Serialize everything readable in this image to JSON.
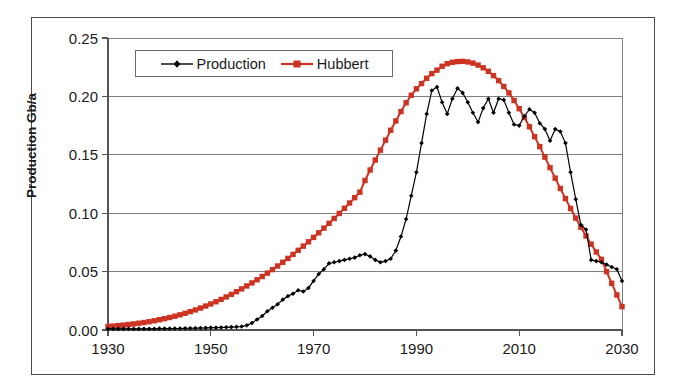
{
  "chart_data": {
    "type": "line",
    "title": "",
    "xlabel": "",
    "ylabel": "Production Gb/a",
    "xlim": [
      1930,
      2030
    ],
    "ylim": [
      0.0,
      0.25
    ],
    "grid": true,
    "legend_position": "top-left-inside",
    "x_ticks": [
      "1930",
      "1950",
      "1970",
      "1990",
      "2010",
      "2030"
    ],
    "x_tick_values": [
      1930,
      1950,
      1970,
      1990,
      2010,
      2030
    ],
    "y_ticks": [
      "0.00",
      "0.05",
      "0.10",
      "0.15",
      "0.20",
      "0.25"
    ],
    "y_tick_values": [
      0.0,
      0.05,
      0.1,
      0.15,
      0.2,
      0.25
    ],
    "x": [
      1930,
      1931,
      1932,
      1933,
      1934,
      1935,
      1936,
      1937,
      1938,
      1939,
      1940,
      1941,
      1942,
      1943,
      1944,
      1945,
      1946,
      1947,
      1948,
      1949,
      1950,
      1951,
      1952,
      1953,
      1954,
      1955,
      1956,
      1957,
      1958,
      1959,
      1960,
      1961,
      1962,
      1963,
      1964,
      1965,
      1966,
      1967,
      1968,
      1969,
      1970,
      1971,
      1972,
      1973,
      1974,
      1975,
      1976,
      1977,
      1978,
      1979,
      1980,
      1981,
      1982,
      1983,
      1984,
      1985,
      1986,
      1987,
      1988,
      1989,
      1990,
      1991,
      1992,
      1993,
      1994,
      1995,
      1996,
      1997,
      1998,
      1999,
      2000,
      2001,
      2002,
      2003,
      2004,
      2005,
      2006,
      2007,
      2008,
      2009,
      2010,
      2011,
      2012,
      2013,
      2014,
      2015,
      2016,
      2017,
      2018,
      2019,
      2020,
      2021,
      2022,
      2023,
      2024,
      2025,
      2026,
      2027,
      2028,
      2029,
      2030
    ],
    "series": [
      {
        "name": "Production",
        "color": "#000000",
        "marker": "diamond",
        "values": [
          0.001,
          0.001,
          0.001,
          0.001,
          0.001,
          0.001,
          0.001,
          0.001,
          0.001,
          0.001,
          0.0012,
          0.0012,
          0.0012,
          0.0013,
          0.0013,
          0.0014,
          0.0015,
          0.0016,
          0.0017,
          0.0018,
          0.002,
          0.002,
          0.0022,
          0.0023,
          0.0025,
          0.0027,
          0.003,
          0.004,
          0.006,
          0.009,
          0.012,
          0.016,
          0.019,
          0.022,
          0.026,
          0.029,
          0.031,
          0.034,
          0.033,
          0.036,
          0.042,
          0.048,
          0.052,
          0.057,
          0.058,
          0.059,
          0.06,
          0.061,
          0.062,
          0.064,
          0.065,
          0.063,
          0.06,
          0.058,
          0.059,
          0.061,
          0.068,
          0.08,
          0.095,
          0.115,
          0.135,
          0.16,
          0.185,
          0.205,
          0.208,
          0.195,
          0.185,
          0.198,
          0.207,
          0.203,
          0.195,
          0.186,
          0.178,
          0.19,
          0.198,
          0.186,
          0.198,
          0.197,
          0.186,
          0.176,
          0.175,
          0.183,
          0.189,
          0.186,
          0.177,
          0.172,
          0.162,
          0.172,
          0.17,
          0.16,
          0.135,
          0.112,
          0.09,
          0.086,
          0.06,
          0.059,
          0.058,
          0.056,
          0.054,
          0.052,
          0.042
        ]
      },
      {
        "name": "Hubbert",
        "color": "#CC3322",
        "marker": "square",
        "values": [
          0.003,
          0.0034,
          0.0038,
          0.0042,
          0.0047,
          0.0052,
          0.0058,
          0.0064,
          0.0071,
          0.0079,
          0.0088,
          0.0097,
          0.0107,
          0.0118,
          0.013,
          0.0143,
          0.0157,
          0.0172,
          0.0188,
          0.0205,
          0.0223,
          0.0242,
          0.0262,
          0.0283,
          0.0305,
          0.0328,
          0.0352,
          0.0377,
          0.0403,
          0.043,
          0.0458,
          0.0487,
          0.0517,
          0.0548,
          0.058,
          0.0613,
          0.0647,
          0.0682,
          0.0718,
          0.0755,
          0.0793,
          0.0832,
          0.0872,
          0.0913,
          0.0955,
          0.0998,
          0.1042,
          0.1087,
          0.1133,
          0.118,
          0.128,
          0.137,
          0.1455,
          0.154,
          0.1625,
          0.171,
          0.179,
          0.187,
          0.1945,
          0.201,
          0.2065,
          0.211,
          0.2155,
          0.2195,
          0.2225,
          0.2258,
          0.228,
          0.2292,
          0.2298,
          0.23,
          0.2295,
          0.2285,
          0.2268,
          0.2245,
          0.2215,
          0.2178,
          0.2135,
          0.2085,
          0.203,
          0.1965,
          0.1895,
          0.182,
          0.174,
          0.1655,
          0.157,
          0.148,
          0.139,
          0.13,
          0.1212,
          0.1125,
          0.104,
          0.0958,
          0.088,
          0.0805,
          0.0735,
          0.0668,
          0.0605,
          0.05,
          0.04,
          0.03,
          0.02
        ]
      }
    ]
  },
  "legend": {
    "entries": [
      {
        "label": "Production"
      },
      {
        "label": "Hubbert"
      }
    ]
  },
  "axes": {
    "y_title": "Production Gb/a"
  },
  "colors": {
    "hubbert_red": "#CC3322",
    "production_black": "#000000",
    "grid_gray": "#808080",
    "frame_gray": "#4a4a4a"
  }
}
